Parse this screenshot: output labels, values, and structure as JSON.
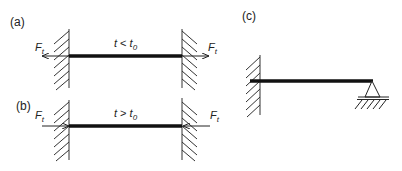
{
  "panels": [
    {
      "id": "a",
      "label": "(a)",
      "condition_var": "t",
      "condition_op": " < ",
      "condition_ref": "t",
      "condition_ref_sub": "0",
      "force_symbol": "F",
      "force_sub": "t",
      "force_direction": "outward (tension)"
    },
    {
      "id": "b",
      "label": "(b)",
      "condition_var": "t",
      "condition_op": " > ",
      "condition_ref": "t",
      "condition_ref_sub": "0",
      "force_symbol": "F",
      "force_sub": "t",
      "force_direction": "inward (compression)"
    },
    {
      "id": "c",
      "label": "(c)",
      "description": "beam fixed at left wall, pinned support at right end"
    }
  ],
  "colors": {
    "line": "#222222",
    "beam": "#111111",
    "background": "#ffffff"
  }
}
